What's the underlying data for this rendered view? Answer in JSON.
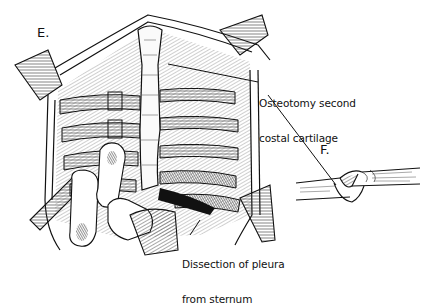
{
  "figure": {
    "panels": [
      {
        "id": "E",
        "label": "E.",
        "description": "Chest cavity opened, sternum exposed with ribs and costal cartilages; surgeon's fingers and retractors"
      },
      {
        "id": "F",
        "label": "F.",
        "description": "Detail of oblique osteotomy through costal cartilage"
      }
    ],
    "callouts": [
      {
        "line1": "Osteotomy second",
        "line2": "costal cartilage"
      },
      {
        "line1": "Dissection of pleura",
        "line2": "from sternum"
      }
    ]
  },
  "colors": {
    "ink": "#111111",
    "background": "#ffffff",
    "shade": "#555555"
  }
}
